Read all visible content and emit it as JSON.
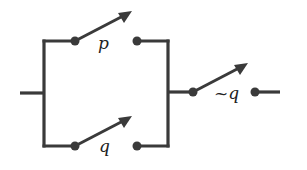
{
  "diagram": {
    "type": "switching-circuit",
    "colors": {
      "wire": "#3a3a3a",
      "label": "#222222",
      "background": "#ffffff"
    },
    "switches": [
      {
        "id": "p",
        "label": "p",
        "branch": "parallel-top"
      },
      {
        "id": "q",
        "label": "q",
        "branch": "parallel-bottom"
      },
      {
        "id": "not-q",
        "label": "~q",
        "branch": "series"
      }
    ]
  }
}
